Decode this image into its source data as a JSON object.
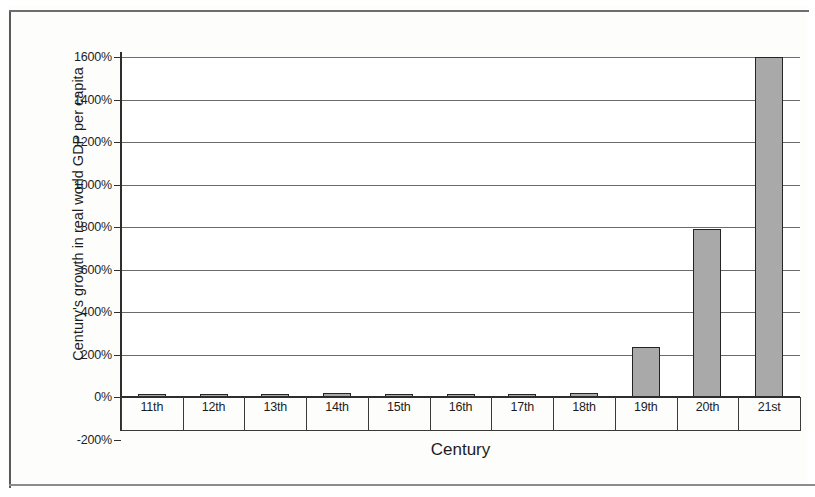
{
  "chart_data": {
    "type": "bar",
    "title": "",
    "xlabel": "Century",
    "ylabel": "Century's growth in real world GDP per capita",
    "categories": [
      "11th",
      "12th",
      "13th",
      "14th",
      "15th",
      "16th",
      "17th",
      "18th",
      "19th",
      "20th",
      "21st"
    ],
    "values": [
      2,
      6,
      5,
      20,
      4,
      7,
      3,
      18,
      235,
      790,
      1600
    ],
    "value_labels": [
      "2%",
      "6%",
      "5%",
      "20%",
      "4%",
      "7%",
      "3%",
      "18%",
      "235%",
      "790%",
      "1600%"
    ],
    "ylim": [
      -200,
      1600
    ],
    "ytick_labels": [
      "1600%",
      "1400%",
      "1200%",
      "1000%",
      "800%",
      "600%",
      "400%",
      "200%",
      "0%",
      "-200%"
    ],
    "ytick_values": [
      1600,
      1400,
      1200,
      1000,
      800,
      600,
      400,
      200,
      0,
      -200
    ],
    "grid": true,
    "grid_axis": "y",
    "legend": "none",
    "bar_fill": "#a9a9a9",
    "bar_stroke": "#242424",
    "plot_background": "#ffffff",
    "axis_color": "#2e2e2e"
  },
  "figure": {
    "page_background": "#fdfdfc",
    "frame_color": "#5a5a5a"
  }
}
